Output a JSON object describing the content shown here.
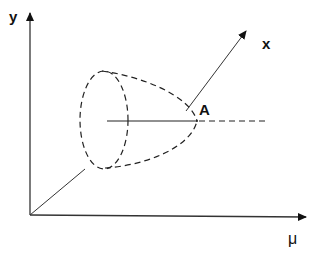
{
  "diagram": {
    "axes": {
      "y_label": "y",
      "x_label": "x",
      "mu_label": "μ"
    },
    "points": {
      "a_label": "A"
    },
    "colors": {
      "stroke": "#222222",
      "background": "#ffffff"
    }
  }
}
